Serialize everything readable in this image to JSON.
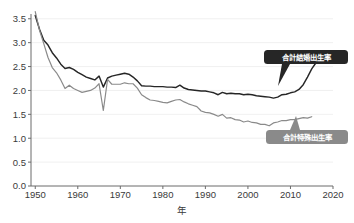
{
  "chart_data": {
    "type": "line",
    "title": "",
    "xlabel": "年",
    "ylabel": "",
    "xlim": [
      1949,
      2020
    ],
    "ylim": [
      0.0,
      3.6
    ],
    "grid": true,
    "grid_orientation": "horizontal",
    "legend_position": "inline-callout",
    "x_ticks": [
      "1950",
      "1960",
      "1970",
      "1980",
      "1990",
      "2000",
      "2010",
      "2020"
    ],
    "x_tick_values": [
      1950,
      1960,
      1970,
      1980,
      1990,
      2000,
      2010,
      2020
    ],
    "y_ticks": [
      "0.0",
      "0.5",
      "1.0",
      "1.5",
      "2.0",
      "2.5",
      "3.0",
      "3.5"
    ],
    "y_tick_values": [
      0.0,
      0.5,
      1.0,
      1.5,
      2.0,
      2.5,
      3.0,
      3.5
    ],
    "series": [
      {
        "name": "合計結婚出生率",
        "color": "#262626",
        "label_text_color": "#ffffff",
        "label_box_color": "#262626",
        "x": [
          1950,
          1951,
          1952,
          1953,
          1954,
          1955,
          1956,
          1957,
          1958,
          1959,
          1960,
          1961,
          1962,
          1963,
          1964,
          1965,
          1966,
          1967,
          1968,
          1969,
          1970,
          1971,
          1972,
          1973,
          1974,
          1975,
          1976,
          1977,
          1978,
          1979,
          1980,
          1981,
          1982,
          1983,
          1984,
          1985,
          1986,
          1987,
          1988,
          1989,
          1990,
          1991,
          1992,
          1993,
          1994,
          1995,
          1996,
          1997,
          1998,
          1999,
          2000,
          2001,
          2002,
          2003,
          2004,
          2005,
          2006,
          2007,
          2008,
          2009,
          2010,
          2011,
          2012,
          2013,
          2014,
          2015,
          2016
        ],
        "values": [
          3.57,
          3.28,
          3.05,
          2.95,
          2.79,
          2.68,
          2.55,
          2.46,
          2.48,
          2.44,
          2.38,
          2.33,
          2.28,
          2.25,
          2.22,
          2.3,
          2.07,
          2.26,
          2.3,
          2.32,
          2.34,
          2.36,
          2.34,
          2.28,
          2.2,
          2.1,
          2.09,
          2.09,
          2.08,
          2.08,
          2.08,
          2.07,
          2.07,
          2.06,
          2.11,
          2.05,
          2.02,
          2.01,
          2.0,
          1.99,
          1.99,
          1.97,
          1.95,
          1.91,
          1.96,
          1.93,
          1.94,
          1.93,
          1.93,
          1.91,
          1.92,
          1.91,
          1.89,
          1.88,
          1.87,
          1.86,
          1.84,
          1.86,
          1.91,
          1.92,
          1.95,
          1.97,
          2.02,
          2.12,
          2.28,
          2.45,
          2.58
        ]
      },
      {
        "name": "合計特殊出生率",
        "color": "#8a8a8a",
        "label_text_color": "#ffffff",
        "label_box_color": "#8a8a8a",
        "x": [
          1950,
          1951,
          1952,
          1953,
          1954,
          1955,
          1956,
          1957,
          1958,
          1959,
          1960,
          1961,
          1962,
          1963,
          1964,
          1965,
          1966,
          1967,
          1968,
          1969,
          1970,
          1971,
          1972,
          1973,
          1974,
          1975,
          1976,
          1977,
          1978,
          1979,
          1980,
          1981,
          1982,
          1983,
          1984,
          1985,
          1986,
          1987,
          1988,
          1989,
          1990,
          1991,
          1992,
          1993,
          1994,
          1995,
          1996,
          1997,
          1998,
          1999,
          2000,
          2001,
          2002,
          2003,
          2004,
          2005,
          2006,
          2007,
          2008,
          2009,
          2010,
          2011,
          2012,
          2013,
          2014,
          2015
        ],
        "values": [
          3.65,
          3.26,
          2.98,
          2.69,
          2.48,
          2.37,
          2.22,
          2.04,
          2.11,
          2.04,
          2.0,
          1.96,
          1.98,
          2.0,
          2.05,
          2.14,
          1.58,
          2.23,
          2.13,
          2.13,
          2.13,
          2.16,
          2.14,
          2.14,
          2.05,
          1.91,
          1.85,
          1.8,
          1.79,
          1.77,
          1.75,
          1.74,
          1.77,
          1.8,
          1.81,
          1.76,
          1.72,
          1.69,
          1.66,
          1.57,
          1.54,
          1.53,
          1.5,
          1.46,
          1.5,
          1.42,
          1.43,
          1.39,
          1.38,
          1.34,
          1.36,
          1.33,
          1.32,
          1.29,
          1.29,
          1.26,
          1.32,
          1.34,
          1.37,
          1.37,
          1.39,
          1.39,
          1.41,
          1.43,
          1.42,
          1.45
        ]
      }
    ],
    "annotations": [
      {
        "id": "callout-marital",
        "text": "合計結婚出生率",
        "anchor_year": 2013,
        "anchor_value": 2.12
      },
      {
        "id": "callout-tfr",
        "text": "合計特殊出生率",
        "anchor_year": 2014,
        "anchor_value": 1.42
      }
    ]
  }
}
